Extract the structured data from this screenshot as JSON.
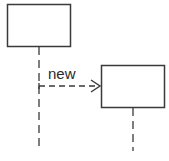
{
  "diagram": {
    "type": "uml-sequence-object-creation",
    "colors": {
      "stroke": "#3a3a3a",
      "background": "#ffffff",
      "text": "#2a2a2a"
    },
    "objects": [
      {
        "id": "creator",
        "label": ""
      },
      {
        "id": "created",
        "label": ""
      }
    ],
    "messages": [
      {
        "from": "creator",
        "to": "created",
        "label": "new",
        "style": "dashed",
        "arrowhead": "open"
      }
    ]
  }
}
